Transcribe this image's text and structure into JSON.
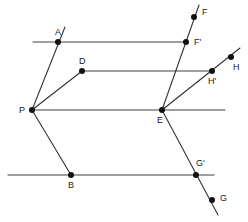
{
  "figure": {
    "title": "",
    "width": 248,
    "height": 222,
    "background_color": "#ffffff",
    "line_color_horizontal": "#808080",
    "line_color_transversal": "#333333",
    "point_color": "#111111",
    "label_color": "#1a1a1a"
  },
  "points": {
    "A": {
      "label": "A",
      "x": 58,
      "y": 42,
      "label_x": 55,
      "label_y": 35
    },
    "B": {
      "label": "B",
      "x": 71,
      "y": 175,
      "label_x": 68,
      "label_y": 188
    },
    "D": {
      "label": "D",
      "x": 82,
      "y": 71,
      "label_x": 79,
      "label_y": 64
    },
    "E": {
      "label": "E",
      "x": 162,
      "y": 110,
      "label_x": 157,
      "label_y": 123
    },
    "F": {
      "label": "F",
      "x": 194,
      "y": 17,
      "label_x": 202,
      "label_y": 15
    },
    "Fp": {
      "label": "F'",
      "x": 186,
      "y": 42,
      "label_x": 194,
      "label_y": 45
    },
    "G": {
      "label": "G",
      "x": 212,
      "y": 200,
      "label_x": 220,
      "label_y": 201
    },
    "Gp": {
      "label": "G'",
      "x": 196,
      "y": 175,
      "label_x": 196,
      "label_y": 166
    },
    "H": {
      "label": "H",
      "x": 231,
      "y": 57,
      "label_x": 233,
      "label_y": 70
    },
    "Hp": {
      "label": "H'",
      "x": 212,
      "y": 71,
      "label_x": 208,
      "label_y": 84
    },
    "P": {
      "label": "P",
      "x": 32,
      "y": 110,
      "label_x": 19,
      "label_y": 113
    }
  },
  "segments": {
    "horizontal": [
      {
        "name": "line-A-Fprime",
        "x1": 33,
        "y1": 42,
        "x2": 186,
        "y2": 42
      },
      {
        "name": "line-D-Hprime",
        "x1": 82,
        "y1": 71,
        "x2": 212,
        "y2": 71
      },
      {
        "name": "line-P-E-right",
        "x1": 32,
        "y1": 110,
        "x2": 225,
        "y2": 110
      },
      {
        "name": "line-B-Gprime",
        "x1": 8,
        "y1": 175,
        "x2": 214,
        "y2": 175
      }
    ],
    "transversal": [
      {
        "name": "ray-P-A",
        "x1": 32,
        "y1": 110,
        "x2": 65,
        "y2": 27
      },
      {
        "name": "ray-P-D",
        "x1": 32,
        "y1": 110,
        "x2": 82,
        "y2": 71
      },
      {
        "name": "ray-P-B",
        "x1": 32,
        "y1": 110,
        "x2": 71,
        "y2": 175
      },
      {
        "name": "line-F-Fprime-E",
        "x1": 199,
        "y1": 5,
        "x2": 162,
        "y2": 110
      },
      {
        "name": "ray-E-H",
        "x1": 162,
        "y1": 110,
        "x2": 240,
        "y2": 48
      },
      {
        "name": "line-E-Gprime-G",
        "x1": 162,
        "y1": 110,
        "x2": 218,
        "y2": 215
      }
    ]
  }
}
